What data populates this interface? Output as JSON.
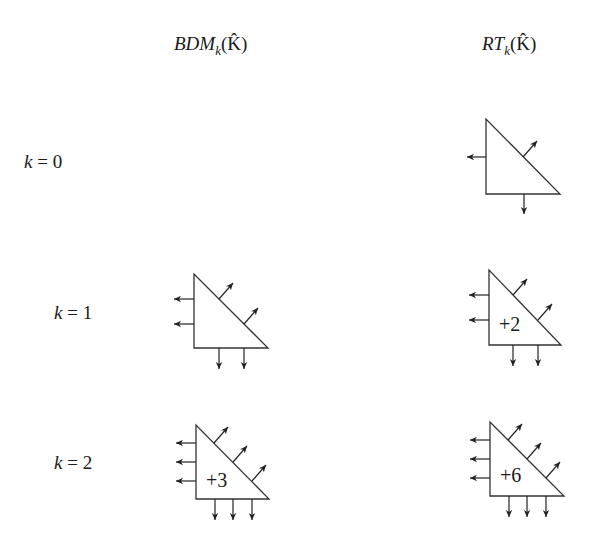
{
  "columns": [
    {
      "id": "bdm",
      "label_base": "BDM",
      "label_sub": "k",
      "label_arg": "(K̂)"
    },
    {
      "id": "rt",
      "label_base": "RT",
      "label_sub": "k",
      "label_arg": "(K̂)"
    }
  ],
  "rows": [
    {
      "var": "k",
      "eq": " = ",
      "value": "0"
    },
    {
      "var": "k",
      "eq": " = ",
      "value": "1"
    },
    {
      "var": "k",
      "eq": " = ",
      "value": "2"
    }
  ],
  "cells": {
    "bdm_k0": {
      "present": false
    },
    "rt_k0": {
      "present": true,
      "edge_dofs_per_edge": 1,
      "interior_label": ""
    },
    "bdm_k1": {
      "present": true,
      "edge_dofs_per_edge": 2,
      "interior_label": ""
    },
    "rt_k1": {
      "present": true,
      "edge_dofs_per_edge": 2,
      "interior_label": "+2"
    },
    "bdm_k2": {
      "present": true,
      "edge_dofs_per_edge": 3,
      "interior_label": "+3"
    },
    "rt_k2": {
      "present": true,
      "edge_dofs_per_edge": 3,
      "interior_label": "+6"
    }
  },
  "colors": {
    "stroke": "#333333",
    "text": "#1a1a1a",
    "background": "#ffffff"
  }
}
